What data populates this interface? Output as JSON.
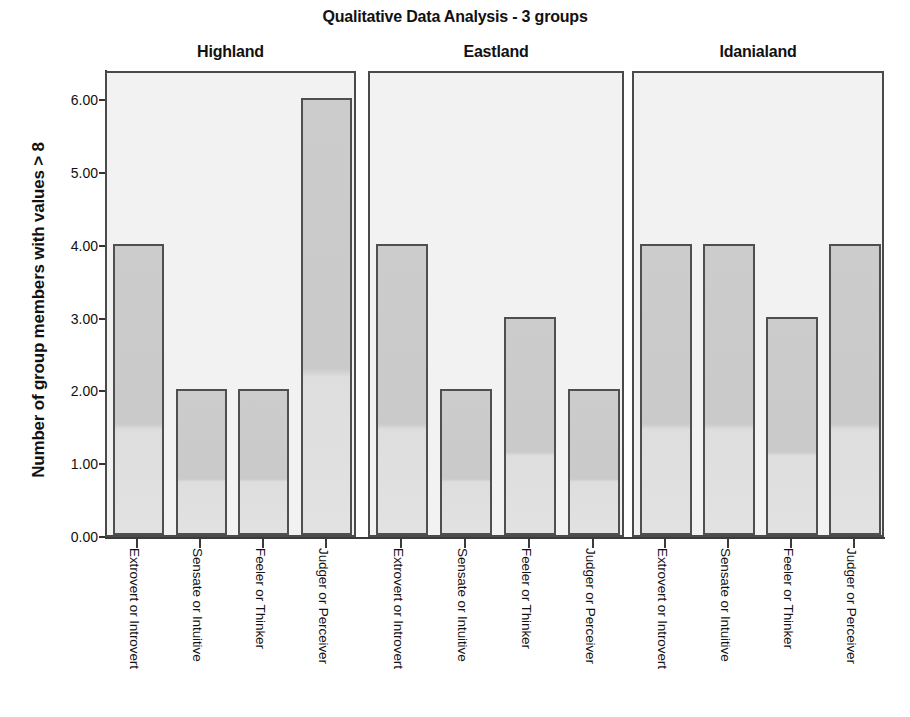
{
  "chart_data": {
    "type": "bar",
    "title": "Qualitative Data Analysis - 3 groups",
    "xlabel": "",
    "ylabel": "Number of group members with values > 8",
    "ylim": [
      0,
      6.4
    ],
    "grid": false,
    "legend": null,
    "panel_variable": "group",
    "categories": [
      "Extrovert or Introvert",
      "Sensate or Intuitive",
      "Feeler or Thinker",
      "Judger or Perceiver"
    ],
    "y_ticks": [
      "0.00",
      "1.00",
      "2.00",
      "3.00",
      "4.00",
      "5.00",
      "6.00"
    ],
    "y_tick_values": [
      0,
      1,
      2,
      3,
      4,
      5,
      6
    ],
    "panels": [
      {
        "name": "Highland",
        "values": [
          4.0,
          2.0,
          2.0,
          6.0
        ]
      },
      {
        "name": "Eastland",
        "values": [
          4.0,
          2.0,
          3.0,
          2.0
        ]
      },
      {
        "name": "Idanialand",
        "values": [
          4.0,
          4.0,
          3.0,
          4.0
        ]
      }
    ],
    "colors": {
      "bar_fill": "#cccccc",
      "bar_border": "#4f4f4f",
      "panel_background": "#f2f2f2",
      "panel_border": "#4a4a4a",
      "axis": "#3a3a3a",
      "text": "#111111",
      "page_background": "#ffffff"
    }
  }
}
